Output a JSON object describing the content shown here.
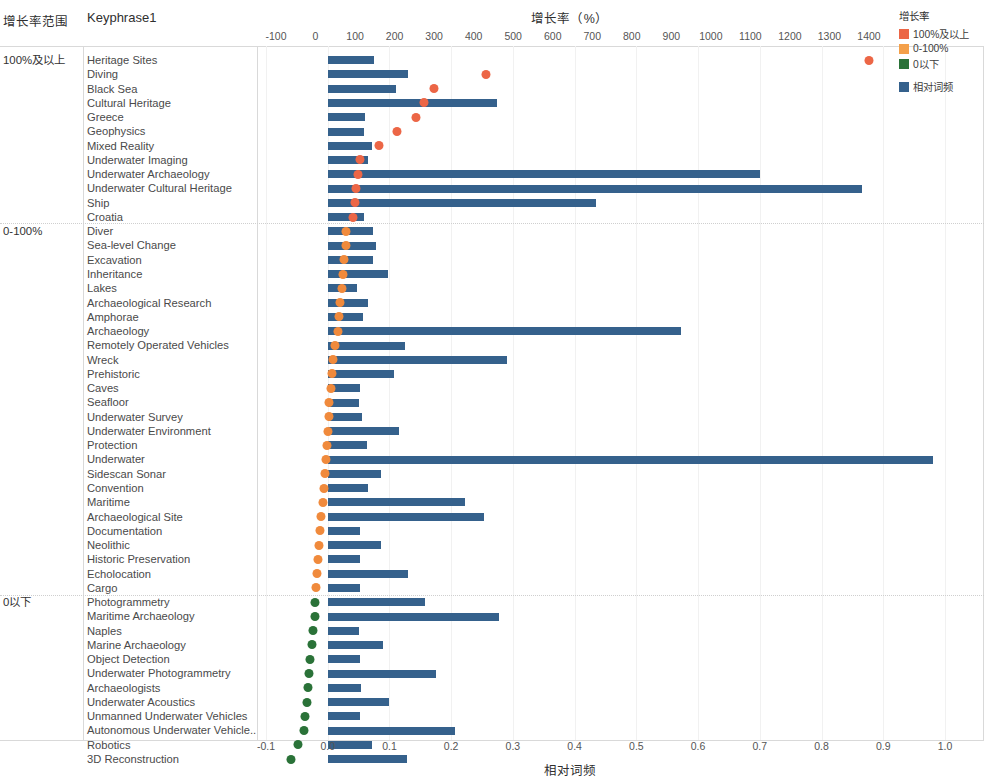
{
  "header": {
    "range_label": "增长率范围",
    "keyphrase_label": "Keyphrase1"
  },
  "legend": {
    "title": "增长率",
    "items": [
      {
        "label": "100%及以上",
        "color": "#ec6646"
      },
      {
        "label": "0-100%",
        "color": "#f4a04a"
      },
      {
        "label": "0以下",
        "color": "#2a7238"
      },
      {
        "label": "相对词频",
        "color": "#35618c"
      }
    ]
  },
  "chart_data": {
    "type": "bar",
    "title": "增长率（%）",
    "xlabel_top": "增长率（%）",
    "xlabel_bottom": "相对词频",
    "ylabel": "Keyphrase1",
    "grid": true,
    "legend_position": "top-right",
    "top_axis": {
      "label": "增长率（%）",
      "ticks": [
        -100,
        0,
        100,
        200,
        300,
        400,
        500,
        600,
        700,
        800,
        900,
        1000,
        1100,
        1200,
        1300,
        1400
      ],
      "range": [
        -100,
        1400
      ]
    },
    "bottom_axis": {
      "label": "相对词频",
      "ticks": [
        "-0.1",
        "0.0",
        "0.1",
        "0.2",
        "0.3",
        "0.4",
        "0.5",
        "0.6",
        "0.7",
        "0.8",
        "0.9",
        "1.0"
      ],
      "range": [
        -0.1,
        1.0
      ]
    },
    "series": [
      {
        "name": "相对词频",
        "type": "bar",
        "color": "#35618c",
        "axis": "bottom"
      },
      {
        "name": "增长率",
        "type": "scatter",
        "axis": "top"
      }
    ],
    "groups": [
      {
        "name": "100%及以上",
        "dot_color": "#ec6646",
        "rows": [
          {
            "keyphrase": "Heritage Sites",
            "freq": 0.075,
            "growth": 1400
          },
          {
            "keyphrase": "Diving",
            "freq": 0.13,
            "growth": 430
          },
          {
            "keyphrase": "Black Sea",
            "freq": 0.11,
            "growth": 300
          },
          {
            "keyphrase": "Cultural Heritage",
            "freq": 0.275,
            "growth": 275
          },
          {
            "keyphrase": "Greece",
            "freq": 0.06,
            "growth": 255
          },
          {
            "keyphrase": "Geophysics",
            "freq": 0.058,
            "growth": 205
          },
          {
            "keyphrase": "Mixed Reality",
            "freq": 0.072,
            "growth": 160
          },
          {
            "keyphrase": "Underwater Imaging",
            "freq": 0.065,
            "growth": 112
          },
          {
            "keyphrase": "Underwater Archaeology",
            "freq": 0.7,
            "growth": 108
          },
          {
            "keyphrase": "Underwater Cultural Heritage",
            "freq": 0.865,
            "growth": 103
          },
          {
            "keyphrase": "Ship",
            "freq": 0.435,
            "growth": 100
          },
          {
            "keyphrase": "Croatia",
            "freq": 0.058,
            "growth": 95
          }
        ]
      },
      {
        "name": "0-100%",
        "dot_color": "#f08a3c",
        "rows": [
          {
            "keyphrase": "Diver",
            "freq": 0.073,
            "growth": 78
          },
          {
            "keyphrase": "Sea-level Change",
            "freq": 0.078,
            "growth": 76
          },
          {
            "keyphrase": "Excavation",
            "freq": 0.073,
            "growth": 73
          },
          {
            "keyphrase": "Inheritance",
            "freq": 0.097,
            "growth": 70
          },
          {
            "keyphrase": "Lakes",
            "freq": 0.048,
            "growth": 66
          },
          {
            "keyphrase": "Archaeological Research",
            "freq": 0.065,
            "growth": 62
          },
          {
            "keyphrase": "Amphorae",
            "freq": 0.057,
            "growth": 60
          },
          {
            "keyphrase": "Archaeology",
            "freq": 0.572,
            "growth": 56
          },
          {
            "keyphrase": "Remotely Operated Vehicles",
            "freq": 0.125,
            "growth": 48
          },
          {
            "keyphrase": "Wreck",
            "freq": 0.29,
            "growth": 44
          },
          {
            "keyphrase": "Prehistoric",
            "freq": 0.108,
            "growth": 41
          },
          {
            "keyphrase": "Caves",
            "freq": 0.053,
            "growth": 38
          },
          {
            "keyphrase": "Seafloor",
            "freq": 0.05,
            "growth": 35
          },
          {
            "keyphrase": "Underwater Survey",
            "freq": 0.056,
            "growth": 33
          },
          {
            "keyphrase": "Underwater Environment",
            "freq": 0.116,
            "growth": 31
          },
          {
            "keyphrase": "Protection",
            "freq": 0.064,
            "growth": 29
          },
          {
            "keyphrase": "Underwater",
            "freq": 0.98,
            "growth": 27
          },
          {
            "keyphrase": "Sidescan Sonar",
            "freq": 0.087,
            "growth": 24
          },
          {
            "keyphrase": "Convention",
            "freq": 0.066,
            "growth": 22
          },
          {
            "keyphrase": "Maritime",
            "freq": 0.222,
            "growth": 18
          },
          {
            "keyphrase": "Archaeological Site",
            "freq": 0.253,
            "growth": 15
          },
          {
            "keyphrase": "Documentation",
            "freq": 0.053,
            "growth": 12
          },
          {
            "keyphrase": "Neolithic",
            "freq": 0.086,
            "growth": 8
          },
          {
            "keyphrase": "Historic Preservation",
            "freq": 0.052,
            "growth": 6
          },
          {
            "keyphrase": "Echolocation",
            "freq": 0.13,
            "growth": 4
          },
          {
            "keyphrase": "Cargo",
            "freq": 0.052,
            "growth": 2
          }
        ]
      },
      {
        "name": "0以下",
        "dot_color": "#2a7238",
        "rows": [
          {
            "keyphrase": "Photogrammetry",
            "freq": 0.157,
            "growth": -1
          },
          {
            "keyphrase": "Maritime Archaeology",
            "freq": 0.277,
            "growth": -2
          },
          {
            "keyphrase": "Naples",
            "freq": 0.05,
            "growth": -7
          },
          {
            "keyphrase": "Marine Archaeology",
            "freq": 0.089,
            "growth": -9
          },
          {
            "keyphrase": "Object Detection",
            "freq": 0.053,
            "growth": -13
          },
          {
            "keyphrase": "Underwater Photogrammetry",
            "freq": 0.175,
            "growth": -16
          },
          {
            "keyphrase": "Archaeologists",
            "freq": 0.054,
            "growth": -20
          },
          {
            "keyphrase": "Underwater Acoustics",
            "freq": 0.1,
            "growth": -22
          },
          {
            "keyphrase": "Unmanned Underwater Vehicles",
            "freq": 0.052,
            "growth": -26
          },
          {
            "keyphrase": "Autonomous Underwater Vehicle..",
            "freq": 0.207,
            "growth": -29
          },
          {
            "keyphrase": "Robotics",
            "freq": 0.072,
            "growth": -45
          },
          {
            "keyphrase": "3D Reconstruction",
            "freq": 0.128,
            "growth": -62
          }
        ]
      }
    ]
  }
}
